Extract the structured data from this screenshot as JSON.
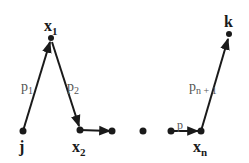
{
  "diagram": {
    "type": "path-graph",
    "colors": {
      "stroke": "#1a1a1a",
      "label": "#555555",
      "background": "#ffffff"
    },
    "nodes": [
      {
        "id": "j",
        "label": "j",
        "sub": "",
        "x": 23,
        "y": 131
      },
      {
        "id": "x1",
        "label": "x",
        "sub": "1",
        "x": 51,
        "y": 38
      },
      {
        "id": "x2",
        "label": "x",
        "sub": "2",
        "x": 80,
        "y": 130
      },
      {
        "id": "a",
        "label": "",
        "sub": "",
        "x": 112,
        "y": 131
      },
      {
        "id": "b",
        "label": "",
        "sub": "",
        "x": 143,
        "y": 131
      },
      {
        "id": "c",
        "label": "",
        "sub": "",
        "x": 171,
        "y": 131
      },
      {
        "id": "xn",
        "label": "x",
        "sub": "n",
        "x": 201,
        "y": 131
      },
      {
        "id": "k",
        "label": "k",
        "sub": "",
        "x": 229,
        "y": 34
      }
    ],
    "edges": [
      {
        "from": "j",
        "to": "x1",
        "label": "p",
        "sub": "1"
      },
      {
        "from": "x1",
        "to": "x2",
        "label": "p",
        "sub": "2"
      },
      {
        "from": "x2",
        "to": "a",
        "label": "",
        "sub": ""
      },
      {
        "from": "c",
        "to": "xn",
        "label": "p",
        "sub": "n"
      },
      {
        "from": "xn",
        "to": "k",
        "label": "p",
        "sub": "n + 1"
      }
    ],
    "labels": {
      "j": "j",
      "x1": "x",
      "x1_sub": "1",
      "x2": "x",
      "x2_sub": "2",
      "xn": "x",
      "xn_sub": "n",
      "k": "k",
      "p1": "p",
      "p1_sub": "1",
      "p2": "p",
      "p2_sub": "2",
      "pn": "p",
      "pn1": "p",
      "pn1_sub": "n + 1"
    }
  }
}
